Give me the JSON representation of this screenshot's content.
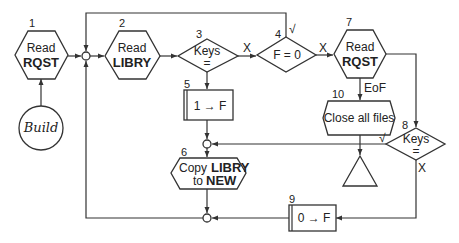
{
  "diagram": {
    "type": "flowchart",
    "nodes": {
      "n1": {
        "number": "1",
        "shape": "hexagon",
        "line1": "Read",
        "line2": "RQST"
      },
      "build": {
        "shape": "circle",
        "label": "Build"
      },
      "n2": {
        "number": "2",
        "shape": "hexagon",
        "line1": "Read",
        "line2": "LIBRY"
      },
      "n3": {
        "number": "3",
        "shape": "diamond",
        "line1": "Keys",
        "line2": "="
      },
      "n4": {
        "number": "4",
        "shape": "diamond",
        "line1": "F = 0"
      },
      "n5": {
        "number": "5",
        "shape": "process-box",
        "line1": "1 → F"
      },
      "n6": {
        "number": "6",
        "shape": "hexagon",
        "line1_a": "Copy",
        "line1_b": "LIBRY",
        "line2_a": "to",
        "line2_b": "NEW"
      },
      "n7": {
        "number": "7",
        "shape": "hexagon",
        "line1": "Read",
        "line2": "RQST"
      },
      "n8": {
        "number": "8",
        "shape": "diamond",
        "line1": "Keys",
        "line2": "="
      },
      "n9": {
        "number": "9",
        "shape": "process-box",
        "line1": "0 → F"
      },
      "n10": {
        "number": "10",
        "shape": "hexagon",
        "line1": "Close all files"
      },
      "end": {
        "shape": "triangle"
      }
    },
    "edge_labels": {
      "n3_x": "X",
      "n4_x": "X",
      "n4_check": "√",
      "n7_eof": "EoF",
      "n8_check": "√",
      "n8_x": "X"
    },
    "edges": [
      {
        "from": "build",
        "to": "n1"
      },
      {
        "from": "n1",
        "to": "junction-a"
      },
      {
        "from": "junction-a",
        "to": "n2"
      },
      {
        "from": "n2",
        "to": "n3"
      },
      {
        "from": "n3",
        "to": "n4",
        "label": "X"
      },
      {
        "from": "n3",
        "to": "n5",
        "label": "="
      },
      {
        "from": "n4",
        "to": "junction-a",
        "label": "√"
      },
      {
        "from": "n4",
        "to": "n7",
        "label": "X"
      },
      {
        "from": "n7",
        "to": "n10",
        "label": "EoF"
      },
      {
        "from": "n7",
        "to": "n8"
      },
      {
        "from": "n10",
        "to": "end"
      },
      {
        "from": "n8",
        "to": "junction-b",
        "label": "√"
      },
      {
        "from": "n8",
        "to": "n9",
        "label": "X"
      },
      {
        "from": "n5",
        "to": "junction-b"
      },
      {
        "from": "junction-b",
        "to": "n6"
      },
      {
        "from": "n6",
        "to": "junction-c"
      },
      {
        "from": "n9",
        "to": "junction-c"
      },
      {
        "from": "junction-c",
        "to": "junction-a"
      }
    ]
  }
}
